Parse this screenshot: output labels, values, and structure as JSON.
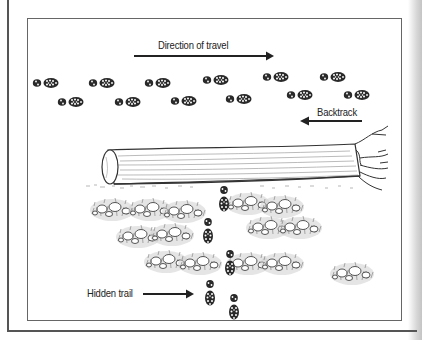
{
  "diagram": {
    "labels": {
      "direction": "Direction of travel",
      "backtrack": "Backtrack",
      "hidden_trail": "Hidden trail"
    },
    "elements": {
      "upper_tracks": "Two rows of boot prints travelling left-to-right",
      "log": "Fallen log with broken, splintered right end",
      "brush": "Clumps of rocks and grass below the log",
      "hidden_trail_prints": "Boot prints heading down through the brush"
    },
    "colors": {
      "ink": "#222222",
      "frame": "#666666",
      "brush": "#888888"
    }
  }
}
